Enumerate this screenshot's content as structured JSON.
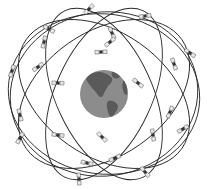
{
  "diagram": {
    "colors": {
      "background": "#ffffff",
      "orbit": "#2a2a2a",
      "earth_ocean": "#8c8c8c",
      "earth_land": "#5a5a5a",
      "satellite_body": "#333333",
      "satellite_panel": "#e8e8e8"
    },
    "earth": {
      "cx": 104,
      "cy": 94,
      "r": 24
    },
    "orbits": [
      {
        "id": "orbit-1",
        "cx": 104,
        "cy": 94,
        "rx": 95,
        "ry": 62,
        "rotate": 35
      },
      {
        "id": "orbit-2",
        "cx": 104,
        "cy": 94,
        "rx": 95,
        "ry": 62,
        "rotate": -35
      },
      {
        "id": "orbit-3",
        "cx": 104,
        "cy": 94,
        "rx": 92,
        "ry": 48,
        "rotate": 65
      },
      {
        "id": "orbit-4",
        "cx": 104,
        "cy": 94,
        "rx": 92,
        "ry": 48,
        "rotate": -65
      },
      {
        "id": "orbit-5",
        "cx": 104,
        "cy": 94,
        "rx": 96,
        "ry": 80,
        "rotate": 8
      },
      {
        "id": "orbit-6",
        "cx": 104,
        "cy": 94,
        "rx": 94,
        "ry": 82,
        "rotate": -8
      }
    ],
    "satellites": [
      {
        "x": 89,
        "y": 9
      },
      {
        "x": 145,
        "y": 16
      },
      {
        "x": 49,
        "y": 29
      },
      {
        "x": 112,
        "y": 33
      },
      {
        "x": 44,
        "y": 42
      },
      {
        "x": 110,
        "y": 42
      },
      {
        "x": 101,
        "y": 52
      },
      {
        "x": 190,
        "y": 53
      },
      {
        "x": 174,
        "y": 64
      },
      {
        "x": 12,
        "y": 71
      },
      {
        "x": 38,
        "y": 67
      },
      {
        "x": 58,
        "y": 83
      },
      {
        "x": 138,
        "y": 83
      },
      {
        "x": 20,
        "y": 115
      },
      {
        "x": 170,
        "y": 112
      },
      {
        "x": 183,
        "y": 129
      },
      {
        "x": 58,
        "y": 135
      },
      {
        "x": 102,
        "y": 137
      },
      {
        "x": 153,
        "y": 135
      },
      {
        "x": 20,
        "y": 138
      },
      {
        "x": 115,
        "y": 158
      },
      {
        "x": 87,
        "y": 163
      },
      {
        "x": 145,
        "y": 172
      },
      {
        "x": 79,
        "y": 179
      }
    ]
  }
}
